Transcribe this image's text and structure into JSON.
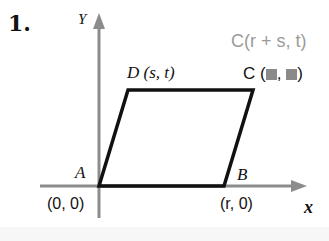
{
  "problem": {
    "number": "1."
  },
  "axes": {
    "y_label": "Y",
    "x_label": "x",
    "axis_color": "#8c8c8c"
  },
  "vertices": {
    "A": {
      "name": "A",
      "coords": "(0, 0)"
    },
    "B": {
      "name": "B",
      "coords": "(r, 0)"
    },
    "C": {
      "name": "C",
      "coords_prefix": "C (",
      "coords_sep": ", ",
      "coords_suffix": ")",
      "hidden_values": [
        "▩",
        "▩"
      ]
    },
    "D": {
      "name": "D",
      "coords": "D (s, t)"
    }
  },
  "answer_annotation": {
    "text": "C(r + s, t)",
    "color": "#9a9a9a"
  },
  "shape": {
    "type": "parallelogram",
    "vertices_order": [
      "A",
      "B",
      "C",
      "D"
    ],
    "stroke_color": "#111111"
  }
}
